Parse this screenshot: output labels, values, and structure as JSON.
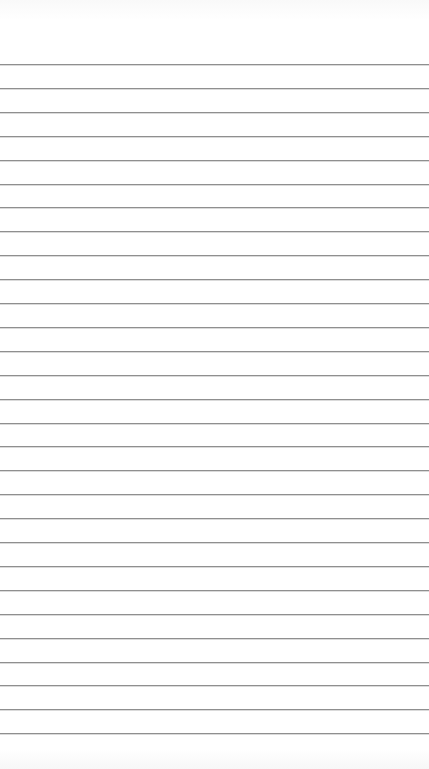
{
  "page": {
    "type": "lined-paper",
    "background_color": "#ffffff",
    "line_color": "#8f8f8f",
    "first_line_y": 64,
    "line_spacing": 23.9,
    "line_count": 29
  }
}
